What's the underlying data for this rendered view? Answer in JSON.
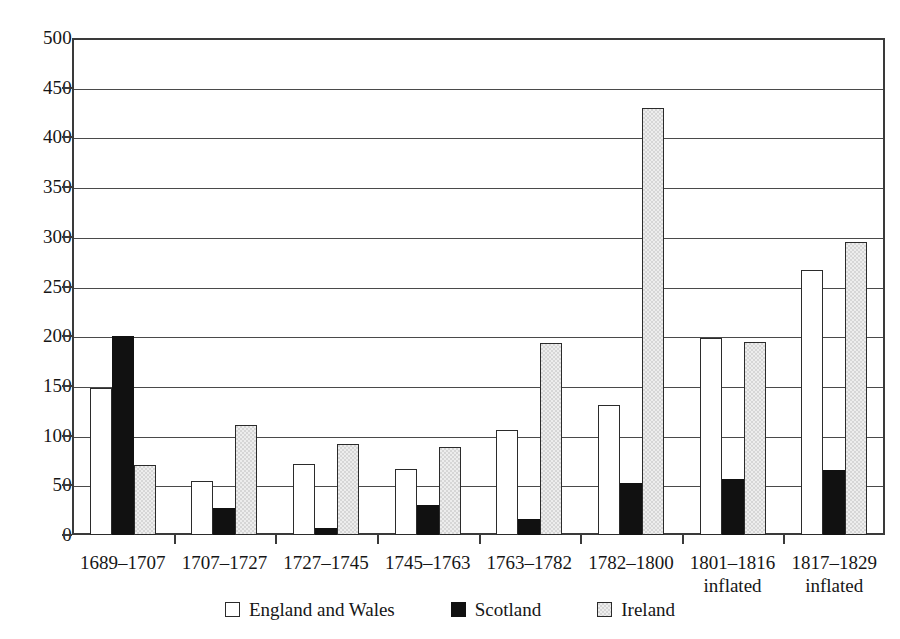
{
  "chart_data": {
    "type": "bar",
    "title": "",
    "subtitle": "",
    "xlabel": "",
    "ylabel": "",
    "ylim": [
      0,
      500
    ],
    "ytick_step": 50,
    "yticks": [
      0,
      50,
      100,
      150,
      200,
      250,
      300,
      350,
      400,
      450,
      500
    ],
    "ytick_labels": [
      "0",
      "50",
      "100",
      "150",
      "200",
      "250",
      "300",
      "350",
      "400",
      "450",
      "500"
    ],
    "grid": true,
    "grid_axis": "y",
    "legend_position": "bottom-center",
    "categories": [
      "1689–1707",
      "1707–1727",
      "1727–1745",
      "1745–1763",
      "1763–1782",
      "1782–1800",
      "1801–1816",
      "1817–1829"
    ],
    "category_sublabels": [
      "",
      "",
      "",
      "",
      "",
      "",
      "inflated",
      "inflated"
    ],
    "series": [
      {
        "name": "England and Wales",
        "color": "#ffffff",
        "values": [
          148,
          54,
          71,
          66,
          106,
          131,
          198,
          267
        ]
      },
      {
        "name": "Scotland",
        "color": "#111111",
        "values": [
          200,
          27,
          7,
          30,
          16,
          52,
          56,
          65
        ]
      },
      {
        "name": "Ireland",
        "color": "#d6d6d6",
        "values": [
          70,
          111,
          92,
          89,
          193,
          430,
          194,
          295
        ]
      }
    ]
  },
  "legend": {
    "items": [
      {
        "label": "England and Wales",
        "swatch": "hollow-square-icon",
        "series_key": "england"
      },
      {
        "label": "Scotland",
        "swatch": "filled-black-square-icon",
        "series_key": "scotland"
      },
      {
        "label": "Ireland",
        "swatch": "filled-gray-square-icon",
        "series_key": "ireland"
      }
    ]
  },
  "colors": {
    "england": "#ffffff",
    "scotland": "#111111",
    "ireland": "#d6d6d6",
    "axis": "#3a3a3a",
    "grid": "#4a4a4a",
    "text": "#161616",
    "background": "#ffffff"
  }
}
